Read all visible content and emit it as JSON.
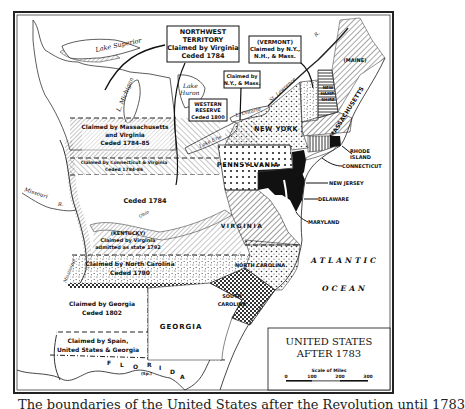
{
  "map": {
    "title_line1": "UNITED STATES",
    "title_line2": "AFTER 1783",
    "scale": {
      "label": "Scale of Miles",
      "ticks": [
        "0",
        "100",
        "200",
        "300"
      ]
    },
    "callouts": {
      "northwest": [
        "NORTHWEST",
        "TERRITORY",
        "Claimed by Virginia",
        "Ceded 1784"
      ],
      "vermont": [
        "(VERMONT)",
        "Claimed by N.Y.,",
        "N.H., & Mass."
      ],
      "ny_mass": [
        "Claimed by",
        "N.Y., & Mass."
      ],
      "western_reserve": [
        "WESTERN",
        "RESERVE",
        "Ceded 1800"
      ]
    },
    "regions": {
      "mass_virginia": [
        "Claimed by Massachusetts",
        "and Virginia",
        "Ceded 1784-85"
      ],
      "conn_virginia": [
        "Claimed by Connecticut & Virginia",
        "Ceded 1784-86"
      ],
      "ceded_1784": "Ceded 1784",
      "kentucky": [
        "(KENTUCKY)",
        "Claimed by Virginia",
        "admitted as state 1792"
      ],
      "north_carolina_claim": [
        "Claimed by North Carolina",
        "Ceded 1790"
      ],
      "georgia_claim": [
        "Claimed by Georgia",
        "Ceded 1802"
      ],
      "spain_claim": [
        "Claimed by Spain,",
        "United States & Georgia"
      ],
      "georgia": "GEORGIA",
      "florida": [
        "F",
        "L",
        "O",
        "R",
        "I",
        "D",
        "A"
      ],
      "florida_sp": "(Sp.)",
      "virginia": "VIRGINIA",
      "north_carolina": "NORTH   CAROLINA",
      "south_carolina": [
        "SOUTH",
        "CAROLINA"
      ],
      "pennsylvania": "PENNSYLVANIA",
      "new_york": "NEW  YORK",
      "maine": "(MAINE)",
      "massachusetts": "MASSACHUSETTS",
      "new_hampshire": [
        "NEW",
        "HAMP-",
        "SHIRE"
      ]
    },
    "state_pointers": {
      "rhode_island": [
        "RHODE",
        "ISLAND"
      ],
      "connecticut": "CONNECTICUT",
      "new_jersey": "NEW JERSEY",
      "delaware": "DELAWARE",
      "maryland": "MARYLAND"
    },
    "water": {
      "lake_superior": "Lake Superior",
      "lake_michigan": "L. Michigan",
      "lake_huron": [
        "Lake",
        "Huron"
      ],
      "lake_erie": "Lake Erie",
      "lake_ontario": "L. Ontario",
      "st_lawrence": "St. Lawrence",
      "st_lawrence_r": "R.",
      "missouri": "Missouri",
      "missouri_r": "R.",
      "mississippi": "Mississippi",
      "ohio": "Ohio",
      "atlantic": "ATLANTIC",
      "ocean": "OCEAN"
    }
  },
  "caption": "The boundaries of the United States after the Revolution until 1783"
}
